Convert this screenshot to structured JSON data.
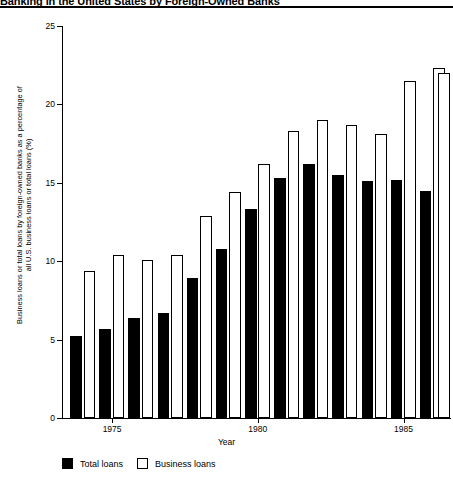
{
  "figure": {
    "title": "Banking in the United States by Foreign-Owned Banks",
    "xtitle": "Year"
  },
  "ylabel": {
    "line1": "Business loans or total loans by foreign-owned banks as a percentage of",
    "line2": "all U.S. business loans or total loans (%)"
  },
  "legend": {
    "total_label": "Total loans",
    "business_label": "Business loans"
  },
  "chart_data": {
    "type": "bar",
    "title": "Banking in the United States by Foreign-Owned Banks",
    "xlabel": "Year",
    "ylabel": "Business loans or total loans by foreign-owned banks as a percentage of all U.S. business loans or total loans (%)",
    "categories": [
      "1974",
      "1975",
      "1976",
      "1977",
      "1978",
      "1979",
      "1980",
      "1981",
      "1982",
      "1983",
      "1984",
      "1985",
      "1986"
    ],
    "tick_labels": [
      "1975",
      "1980",
      "1985"
    ],
    "tick_categories": [
      "1975",
      "1980",
      "1985"
    ],
    "series": [
      {
        "name": "Total loans",
        "color": "#000000",
        "values": [
          5.2,
          5.7,
          6.4,
          6.7,
          8.9,
          10.8,
          13.3,
          15.3,
          16.2,
          15.5,
          15.1,
          15.2,
          14.5
        ]
      },
      {
        "name": "Business loans",
        "color": "#ffffff",
        "values": [
          9.4,
          10.4,
          10.1,
          10.4,
          12.9,
          14.4,
          16.2,
          18.3,
          19.0,
          18.7,
          18.1,
          21.5,
          22.3
        ]
      }
    ],
    "extra_business_value": 22.0,
    "ylim": [
      0,
      25
    ],
    "yticks": [
      0,
      5,
      10,
      15,
      20,
      25
    ],
    "grid": false,
    "legend_position": "bottom-left"
  }
}
